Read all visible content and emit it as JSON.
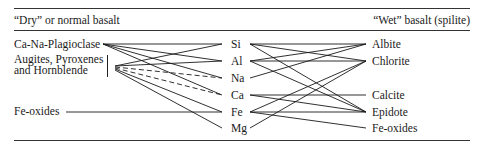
{
  "header": {
    "left_title": "“Dry” or normal basalt",
    "right_title": "“Wet”  basalt  (spilite)"
  },
  "left_minerals": [
    {
      "id": "plag",
      "label": "Ca-Na-Plagioclase"
    },
    {
      "id": "aug",
      "label_line1": "Augites, Pyroxenes",
      "label_line2": "and Hornblende"
    },
    {
      "id": "feox",
      "label": "Fe-oxides"
    }
  ],
  "elements": [
    {
      "id": "Si",
      "label": "Si"
    },
    {
      "id": "Al",
      "label": "Al"
    },
    {
      "id": "Na",
      "label": "Na"
    },
    {
      "id": "Ca",
      "label": "Ca"
    },
    {
      "id": "Fe",
      "label": "Fe"
    },
    {
      "id": "Mg",
      "label": "Mg"
    }
  ],
  "right_minerals": [
    {
      "id": "albite",
      "label": "Albite"
    },
    {
      "id": "chlorite",
      "label": "Chlorite"
    },
    {
      "id": "calcite",
      "label": "Calcite"
    },
    {
      "id": "epidote",
      "label": "Epidote"
    },
    {
      "id": "feox2",
      "label": "Fe-oxides"
    }
  ],
  "links_left": [
    {
      "from": "Ca-Na-Plagioclase",
      "to": "Si",
      "style": "solid"
    },
    {
      "from": "Ca-Na-Plagioclase",
      "to": "Al",
      "style": "solid"
    },
    {
      "from": "Ca-Na-Plagioclase",
      "to": "Na",
      "style": "solid"
    },
    {
      "from": "Ca-Na-Plagioclase",
      "to": "Ca",
      "style": "solid"
    },
    {
      "from": "Augites, Pyroxenes and Hornblende",
      "to": "Si",
      "style": "solid"
    },
    {
      "from": "Augites, Pyroxenes and Hornblende",
      "to": "Al",
      "style": "solid"
    },
    {
      "from": "Augites, Pyroxenes and Hornblende",
      "to": "Na",
      "style": "dashed"
    },
    {
      "from": "Augites, Pyroxenes and Hornblende",
      "to": "Ca",
      "style": "dashed"
    },
    {
      "from": "Augites, Pyroxenes and Hornblende",
      "to": "Fe",
      "style": "solid"
    },
    {
      "from": "Augites, Pyroxenes and Hornblende",
      "to": "Mg",
      "style": "solid"
    },
    {
      "from": "Fe-oxides",
      "to": "Fe",
      "style": "solid"
    }
  ],
  "links_right": [
    {
      "from": "Si",
      "to": "Albite"
    },
    {
      "from": "Si",
      "to": "Chlorite"
    },
    {
      "from": "Si",
      "to": "Epidote"
    },
    {
      "from": "Al",
      "to": "Albite"
    },
    {
      "from": "Al",
      "to": "Chlorite"
    },
    {
      "from": "Al",
      "to": "Epidote"
    },
    {
      "from": "Na",
      "to": "Albite"
    },
    {
      "from": "Ca",
      "to": "Calcite"
    },
    {
      "from": "Ca",
      "to": "Epidote"
    },
    {
      "from": "Fe",
      "to": "Chlorite"
    },
    {
      "from": "Fe",
      "to": "Epidote"
    },
    {
      "from": "Fe",
      "to": "Fe-oxides"
    },
    {
      "from": "Mg",
      "to": "Chlorite"
    }
  ]
}
